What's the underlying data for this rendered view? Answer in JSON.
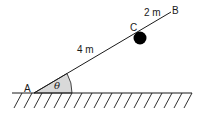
{
  "diagram": {
    "points": {
      "A": {
        "label": "A"
      },
      "B": {
        "label": "B"
      },
      "C": {
        "label": "C"
      }
    },
    "segments": {
      "AC": {
        "label": "4 m"
      },
      "CB": {
        "label": "2 m"
      }
    },
    "angle": {
      "label": "θ",
      "fill": "#d9d9d9"
    },
    "ball": {
      "color": "#000000"
    },
    "line_color": "#1a1a1a"
  }
}
